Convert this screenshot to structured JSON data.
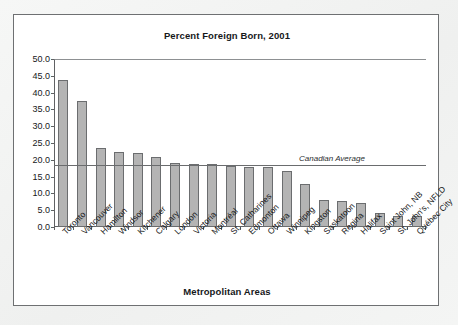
{
  "card": {
    "title": "Percent Foreign Born, 2001",
    "x_axis_title": "Metropolitan Areas"
  },
  "annotation": {
    "average_label": "Canadian Average"
  },
  "chart_data": {
    "type": "bar",
    "title": "Percent Foreign Born, 2001",
    "xlabel": "Metropolitan Areas",
    "ylabel": "",
    "ylim": [
      0,
      50
    ],
    "ytick_step": 5,
    "ytick_labels": [
      "0.0",
      "5.0",
      "10.0",
      "15.0",
      "20.0",
      "25.0",
      "30.0",
      "35.0",
      "40.0",
      "45.0",
      "50.0"
    ],
    "grid": false,
    "legend": "none",
    "reference_line": {
      "label": "Canadian Average",
      "value": 18.4
    },
    "categories": [
      "Toronto",
      "Vancouver",
      "Hamilton",
      "Windsor",
      "Kitchener",
      "Calgary",
      "London",
      "Victoria",
      "Montréal",
      "St. Catharines",
      "Edmonton",
      "Ottawa",
      "Winnipeg",
      "Kingston",
      "Saskatoon",
      "Regina",
      "Halifax",
      "Saint John, NB",
      "St. John's, NFLD",
      "Québec City"
    ],
    "values": [
      43.7,
      37.5,
      23.6,
      22.3,
      22.0,
      20.9,
      19.0,
      18.9,
      18.7,
      18.1,
      18.0,
      17.8,
      16.8,
      12.7,
      7.9,
      7.7,
      7.1,
      4.2,
      3.3,
      3.3
    ]
  }
}
